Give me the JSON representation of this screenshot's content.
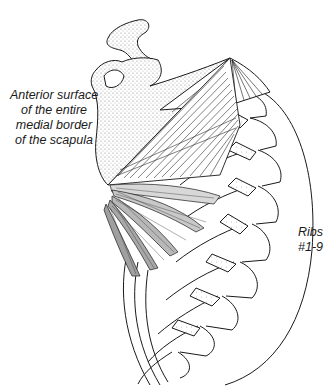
{
  "figure": {
    "labels": {
      "scapula_origin": [
        "Anterior surface",
        "of the entire",
        "medial border",
        "of the scapula"
      ],
      "ribs": [
        "Ribs",
        "#1-9"
      ]
    },
    "colors": {
      "background": "#ffffff",
      "ink": "#1a1a1a",
      "stipple": "#9a9a9a"
    }
  }
}
